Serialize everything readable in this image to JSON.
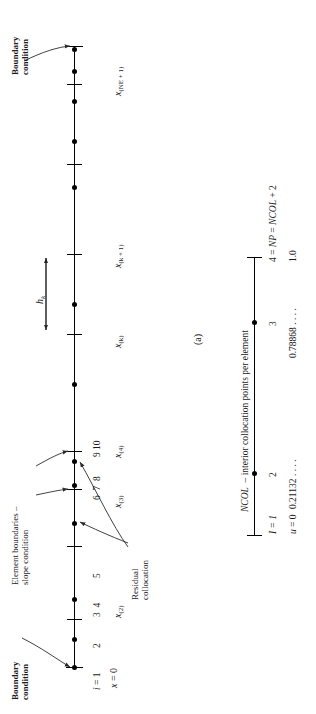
{
  "figure": {
    "panel_label": "(a)",
    "caption_note": "NCOL – interior collocation points per element"
  },
  "panel_a": {
    "annotations": [
      {
        "id": "bc-left",
        "text_line1": "Boundary",
        "text_line2": "condition"
      },
      {
        "id": "bc-right",
        "text_line1": "Boundary",
        "text_line2": "condition"
      },
      {
        "id": "elem-bnd",
        "text_line1": "Element boundaries –",
        "text_line2": "slope condition"
      },
      {
        "id": "residual",
        "text_line1": "Residual",
        "text_line2": "collocation"
      }
    ],
    "element_length_label": "h",
    "element_length_sub": "k",
    "origin_label": "x = 0",
    "node_numbers": [
      "i = 1",
      "2",
      "3 4",
      "5",
      "6 7 8",
      "9 10"
    ],
    "node_index_first": "i = 1",
    "station_labels": [
      {
        "base": "x",
        "sub": "(2)"
      },
      {
        "base": "x",
        "sub": "(3)"
      },
      {
        "base": "x",
        "sub": "(4)"
      },
      {
        "base": "x",
        "sub": "(k)"
      },
      {
        "base": "x",
        "sub": "(k + 1)"
      },
      {
        "base": "x",
        "sub": "(NE + 1)"
      }
    ]
  },
  "panel_b": {
    "title": "NCOL – interior collocation points per element",
    "index_row_label": "I = 1",
    "value_row_label": "u = 0",
    "points": [
      {
        "index": "I = 1",
        "value": "u = 0",
        "kind": "endpoint"
      },
      {
        "index": "2",
        "value": "0.21132 . . . .",
        "kind": "interior"
      },
      {
        "index": "3",
        "value": "0.78868 . . . .",
        "kind": "interior"
      },
      {
        "index": "4 = NP = NCOL + 2",
        "value": "1.0",
        "kind": "endpoint"
      }
    ]
  },
  "colors": {
    "ink": "#1a1a1a",
    "line": "#000000",
    "leader": "#2b2b2b",
    "background": "#ffffff"
  }
}
